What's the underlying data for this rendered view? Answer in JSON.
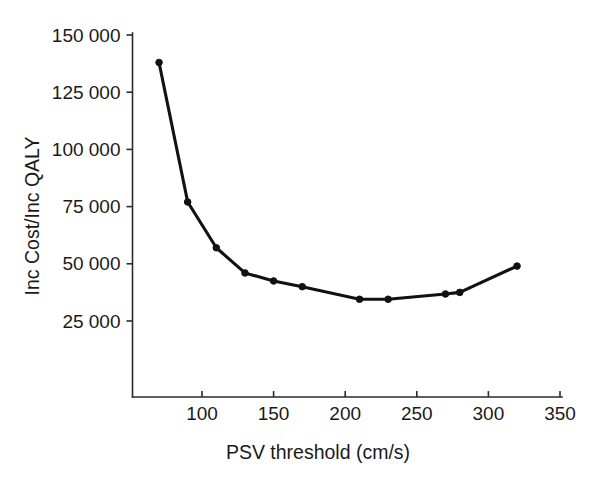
{
  "figure": {
    "background_color": "#ffffff",
    "ink_color": "#111111"
  },
  "chart_data": {
    "type": "line",
    "title": "",
    "xlabel": "PSV threshold (cm/s)",
    "ylabel": "Inc Cost/Inc QALY",
    "xlim": [
      55,
      365
    ],
    "ylim": [
      12000,
      155000
    ],
    "grid": false,
    "legend": null,
    "xticks": [
      100,
      150,
      200,
      250,
      300,
      350
    ],
    "xtick_labels": [
      "100",
      "150",
      "200",
      "250",
      "300",
      "350"
    ],
    "yticks": [
      25000,
      50000,
      75000,
      100000,
      125000,
      150000
    ],
    "ytick_labels": [
      "25 000",
      "50 000",
      "75 000",
      "100 000",
      "125 000",
      "150 000"
    ],
    "marker": "circle",
    "x": [
      70,
      90,
      110,
      130,
      150,
      170,
      210,
      230,
      270,
      280,
      320
    ],
    "values": [
      138000,
      77000,
      57000,
      46000,
      42500,
      40000,
      34500,
      34500,
      36800,
      37500,
      49000
    ],
    "series": [
      {
        "name": "Incremental cost-effectiveness ratio",
        "color": "#111111",
        "x": [
          70,
          90,
          110,
          130,
          150,
          170,
          210,
          230,
          270,
          280,
          320
        ],
        "values": [
          138000,
          77000,
          57000,
          46000,
          42500,
          40000,
          34500,
          34500,
          36800,
          37500,
          49000
        ]
      }
    ]
  }
}
